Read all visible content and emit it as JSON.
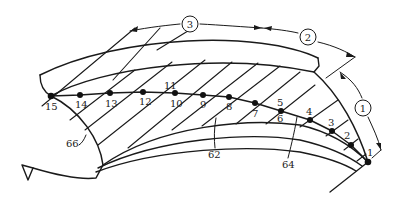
{
  "diagram": {
    "type": "technical-blade-section",
    "colors": {
      "line": "#1a1a1a",
      "background": "#ffffff"
    },
    "zones": [
      {
        "id": "1",
        "label": "1"
      },
      {
        "id": "2",
        "label": "2"
      },
      {
        "id": "3",
        "label": "3"
      }
    ],
    "points": [
      {
        "label": "1",
        "x": 368,
        "y": 162
      },
      {
        "label": "2",
        "x": 351,
        "y": 145
      },
      {
        "label": "3",
        "x": 332,
        "y": 131
      },
      {
        "label": "4",
        "x": 310,
        "y": 120
      },
      {
        "label": "5",
        "x": 281,
        "y": 111
      },
      {
        "label": "6",
        "x": 281,
        "y": 111
      },
      {
        "label": "7",
        "x": 255,
        "y": 103
      },
      {
        "label": "8",
        "x": 229,
        "y": 97
      },
      {
        "label": "9",
        "x": 203,
        "y": 95
      },
      {
        "label": "10",
        "x": 175,
        "y": 93
      },
      {
        "label": "11",
        "x": 175,
        "y": 93
      },
      {
        "label": "12",
        "x": 143,
        "y": 92
      },
      {
        "label": "13",
        "x": 110,
        "y": 93
      },
      {
        "label": "14",
        "x": 80,
        "y": 95
      },
      {
        "label": "15",
        "x": 51,
        "y": 96
      }
    ],
    "reference_labels": [
      {
        "label": "62"
      },
      {
        "label": "64"
      },
      {
        "label": "66"
      }
    ]
  }
}
